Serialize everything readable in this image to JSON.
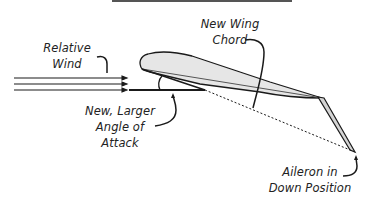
{
  "diagram": {
    "labels": {
      "relative_wind": {
        "line1": "Relative",
        "line2": "Wind"
      },
      "new_wing_chord": {
        "line1": "New Wing",
        "line2": "Chord"
      },
      "angle_of_attack": {
        "line1": "New, Larger",
        "line2": "Angle of",
        "line3": "Attack"
      },
      "aileron": {
        "line1": "Aileron in",
        "line2": "Down Position"
      }
    },
    "colors": {
      "stroke": "#1a1a1a",
      "wing_fill": "#e6e6e6",
      "aileron_fill": "#d4d4d4",
      "top_rule": "#555555",
      "text": "#222222"
    }
  }
}
